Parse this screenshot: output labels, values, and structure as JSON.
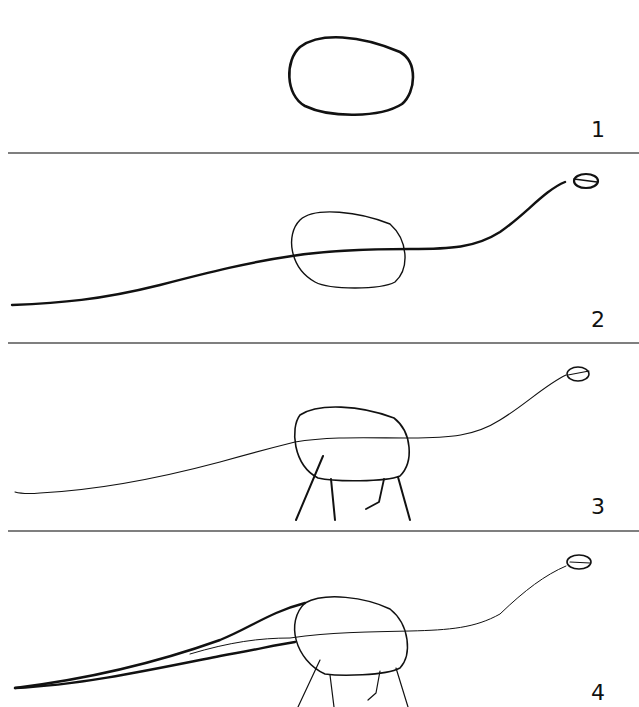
{
  "figure": {
    "steps": [
      {
        "number": "1",
        "description": "Draw an oval for the body"
      },
      {
        "number": "2",
        "description": "Add a long curving line for neck and tail with a small oval head"
      },
      {
        "number": "3",
        "description": "Add four legs"
      },
      {
        "number": "4",
        "description": "Thicken the tail"
      }
    ]
  },
  "colors": {
    "ink": "#111111",
    "divider": "#555555",
    "background": "#ffffff"
  }
}
